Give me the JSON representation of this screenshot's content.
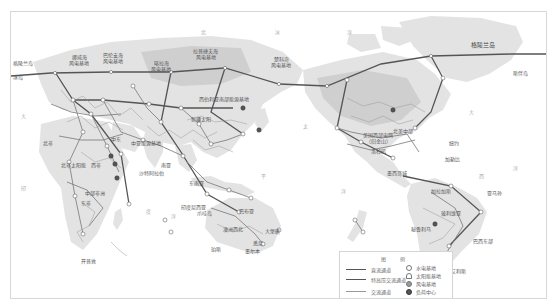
{
  "map": {
    "type": "world-energy-interconnection-map",
    "colors": {
      "land": "#e3e3e3",
      "land_highlight": "#cfcfcf",
      "ocean": "#ffffff",
      "main_corridor": "#555555",
      "cross_border": "#666666",
      "ac_line": "#888888",
      "frame": "#d8d8d8"
    },
    "ocean_labels": [
      "北",
      "冰",
      "洋",
      "大",
      "西",
      "洋",
      "印",
      "度",
      "洋",
      "太",
      "平",
      "洋",
      "太",
      "平",
      "洋",
      "大",
      "西",
      "洋",
      "大",
      "西",
      "洋"
    ],
    "place_labels": {
      "greenland": "格陵兰岛",
      "greenland_east": "格陵兰岛",
      "iceland": "冰岛",
      "greenland_south": "斯伴岛",
      "north_sea": "挪威海\n风电基地",
      "barents": "巴伦支海\n风电基地",
      "yamal": "喀拉海\n风电基地",
      "east_siberia": "拉普捷夫海\n风电基地",
      "chukotka": "楚科奇\n风电基地",
      "central_asia": "中亚能源基地",
      "mongolia_north": "西伯利亚南部能源基地",
      "china_west": "新疆太阳",
      "north_africa": "北非",
      "west_africa": "西非",
      "saudi": "沙特阿拉伯",
      "sahara": "北非太阳能",
      "central_africa": "中部非洲",
      "east_africa": "东非",
      "south_africa": "开普敦",
      "middle_east": "中东",
      "india": "印度洋",
      "south_asia": "南亚",
      "southeast_asia": "东南亚",
      "indonesia": "印度尼西亚",
      "sumatra": "苏门答腊",
      "java": "爪哇岛",
      "papua": "巴布亚",
      "australia_center": "澳洲西北",
      "australia_east": "大堡礁",
      "australia_se": "悉尼",
      "australia_south": "墨尔本",
      "australia_west": "珀斯",
      "north_america_west": "美国西部电网\n（旧金山）",
      "la": "洛杉矶",
      "north_america_central": "北美中部",
      "mexico": "墨西哥城",
      "us_east": "纽约",
      "caribbean": "加勒比",
      "venezuela": "加拉加斯",
      "amazon": "亚马孙",
      "bolivia": "玻利维亚",
      "brazil_east": "巴西东部",
      "argentina": "布宜诺斯艾利斯",
      "peru": "秘鲁利马"
    }
  },
  "legend": {
    "title": "图  例",
    "lines": [
      {
        "label": "直流通道",
        "style": "main"
      },
      {
        "label": "特高压交流通道",
        "style": "cross"
      },
      {
        "label": "交流通道",
        "style": "ac"
      }
    ],
    "symbols": [
      {
        "label": "水电基地",
        "icon": "hydro"
      },
      {
        "label": "太阳能基地",
        "icon": "solar"
      },
      {
        "label": "风电基地",
        "icon": "wind"
      },
      {
        "label": "负荷中心",
        "icon": "load"
      }
    ]
  }
}
